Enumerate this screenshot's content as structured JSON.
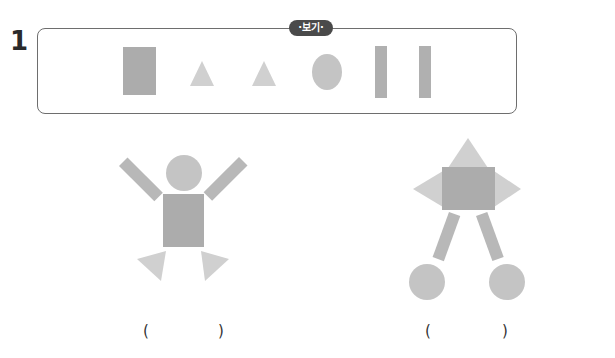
{
  "question": {
    "number": "1",
    "example_label": "·보기·"
  },
  "example_shapes": [
    {
      "type": "rectangle",
      "color": "#acacac"
    },
    {
      "type": "triangle",
      "color": "#d0d0d0"
    },
    {
      "type": "triangle",
      "color": "#d0d0d0"
    },
    {
      "type": "circle",
      "color": "#c4c4c4"
    },
    {
      "type": "bar",
      "color": "#b0b0b0"
    },
    {
      "type": "bar",
      "color": "#b0b0b0"
    }
  ],
  "figures": [
    {
      "name": "person-figure",
      "description": "circle head, rectangle body, two bar arms, two triangle feet"
    },
    {
      "name": "robot-figure",
      "description": "triangle top, rectangle body, two triangle sides, two bar legs, two circle feet"
    }
  ],
  "answers": [
    {
      "open": "(",
      "close": ")"
    },
    {
      "open": "(",
      "close": ")"
    }
  ],
  "colors": {
    "rect": "#acacac",
    "triangle": "#d0d0d0",
    "circle": "#c4c4c4",
    "bar": "#b0b0b0",
    "border": "#6e6e6e",
    "badge": "#4a4a4a"
  }
}
